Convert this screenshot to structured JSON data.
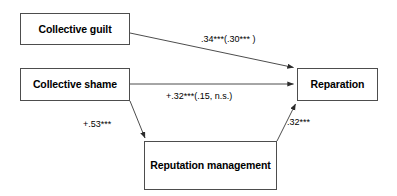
{
  "diagram": {
    "type": "path-model",
    "background_color": "#ffffff",
    "line_color": "#4d4d4d",
    "text_color": "#000000",
    "nodes": [
      {
        "id": "collective_guilt",
        "label": "Collective guilt"
      },
      {
        "id": "collective_shame",
        "label": "Collective shame"
      },
      {
        "id": "reparation",
        "label": "Reparation"
      },
      {
        "id": "reputation_management",
        "label": "Reputation management"
      }
    ],
    "edges": [
      {
        "id": "guilt_to_reparation",
        "from": "collective_guilt",
        "to": "reparation",
        "label": ".34***(.30*** )"
      },
      {
        "id": "shame_to_reparation",
        "from": "collective_shame",
        "to": "reparation",
        "label": "+.32***(.15, n.s.)"
      },
      {
        "id": "shame_to_reputation",
        "from": "collective_shame",
        "to": "reputation_management",
        "label": "+.53***"
      },
      {
        "id": "reputation_to_reparation",
        "from": "reputation_management",
        "to": "reparation",
        "label": ".32***"
      }
    ]
  }
}
